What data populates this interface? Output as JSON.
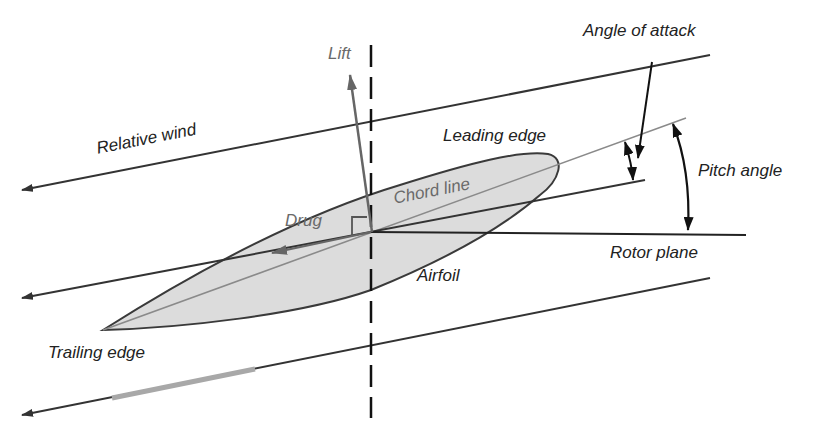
{
  "diagram": {
    "labels": {
      "lift": "Lift",
      "relative_wind": "Relative wind",
      "leading_edge": "Leading edge",
      "chord_line": "Chord line",
      "drag": "Drug",
      "airfoil": "Airfoil",
      "trailing_edge": "Trailing edge",
      "angle_of_attack": "Angle of attack",
      "pitch_angle": "Pitch angle",
      "rotor_plane": "Rotor plane"
    },
    "colors": {
      "line": "#333333",
      "gray_line": "#8a8a8a",
      "airfoil_fill": "#dcdcdc",
      "force_arrow": "#666666",
      "background": "#ffffff"
    }
  }
}
